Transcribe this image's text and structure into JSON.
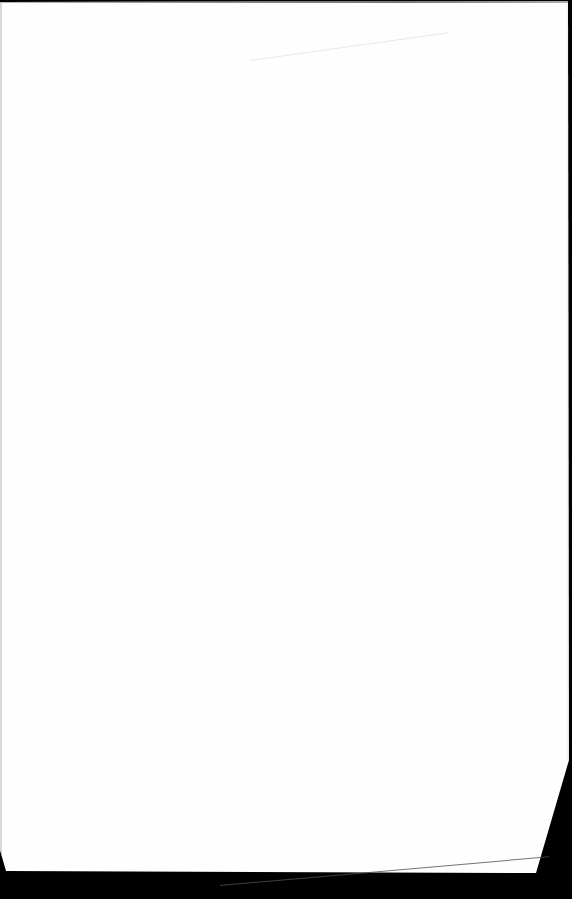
{
  "page": {
    "type": "scanned-blank-page",
    "text": "",
    "colors": {
      "paper": "#fefefe",
      "background": "#000000",
      "top_edge_shadow": "#5a5a5a"
    }
  }
}
